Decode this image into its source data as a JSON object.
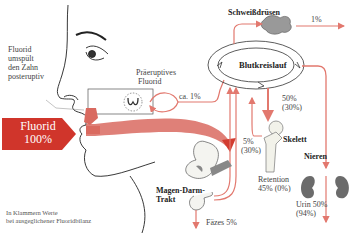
{
  "diagram": {
    "colors": {
      "flow": "#e2786e",
      "flow_dark": "#d23c30",
      "badge": "#d0352b",
      "organ_gray": "#6b6b6b",
      "line": "#222222"
    },
    "source": {
      "label_line1": "Fluorid",
      "label_line2": "100%"
    },
    "posteruptive_note": {
      "line1": "Fluorid",
      "line2": "umspült",
      "line3": "den Zahn",
      "line4": "posteruptiv"
    },
    "preeruptive": {
      "line1": "Präeruptives",
      "line2": "Fluorid",
      "share": "ca. 1%"
    },
    "nodes": {
      "circulation": "Blutkreislauf",
      "sweat_glands": "Schweißdrüsen",
      "skeleton": "Skelett",
      "kidneys": "Nieren",
      "gi_tract_line1": "Magen-Darm-",
      "gi_tract_line2": "Trakt"
    },
    "flows": {
      "sweat": "1%",
      "to_skeleton_line1": "50%",
      "to_skeleton_line2": "(30%)",
      "from_skeleton_line1": "5%",
      "from_skeleton_line2": "(30%)",
      "retention_line1": "Retention",
      "retention_line2": "45% (0%)",
      "feces": "Fäzes 5%",
      "urine_line1": "Urin 50%",
      "urine_line2": "(94%)"
    },
    "footnote": {
      "line1": "In Klammern Werte",
      "line2": "bei ausgeglichener Fluoridbilanz"
    }
  }
}
